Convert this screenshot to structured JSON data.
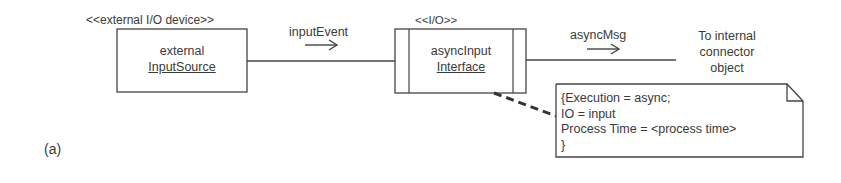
{
  "diagram": {
    "label": "(a)",
    "external_device": {
      "stereotype": "<<external I/O device>>",
      "name_line1": "external",
      "name_line2": "InputSource"
    },
    "io_interface": {
      "stereotype": "<<I/O>>",
      "name_line1": "asyncInput",
      "name_line2": "Interface"
    },
    "messages": {
      "input_event": "inputEvent",
      "async_msg": "asyncMsg"
    },
    "target": {
      "line1": "To internal",
      "line2": "connector",
      "line3": "object"
    },
    "note": {
      "line1": "{Execution = async;",
      "line2": "IO = input",
      "line3": "Process Time = <process time>",
      "line4": "}"
    },
    "colors": {
      "stroke": "#444444",
      "text": "#3a3a3a",
      "background": "#ffffff"
    }
  }
}
